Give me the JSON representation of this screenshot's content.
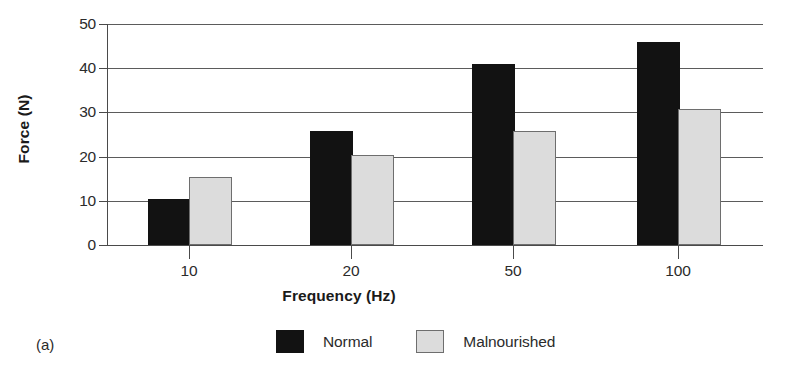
{
  "figure": {
    "letter": "(a)"
  },
  "chart_data": {
    "type": "bar",
    "title": "",
    "xlabel": "Frequency (Hz)",
    "ylabel": "Force (N)",
    "categories": [
      "10",
      "20",
      "50",
      "100"
    ],
    "series": [
      {
        "name": "Normal",
        "color": "#121212",
        "values": [
          10,
          25.3,
          40.5,
          45.5
        ]
      },
      {
        "name": "Malnourished",
        "color": "#dcdcdc",
        "values": [
          15,
          20,
          25.3,
          30.3
        ]
      }
    ],
    "ylim": [
      0,
      50
    ],
    "yticks": [
      "0",
      "10",
      "20",
      "30",
      "40",
      "50"
    ],
    "ytick_values": [
      0,
      10,
      20,
      30,
      40,
      50
    ],
    "grid": true,
    "grid_axis": "y",
    "legend_position": "bottom-center"
  },
  "legend": {
    "items": [
      {
        "label": "Normal",
        "swatch": "normal"
      },
      {
        "label": "Malnourished",
        "swatch": "malnourished"
      }
    ]
  }
}
